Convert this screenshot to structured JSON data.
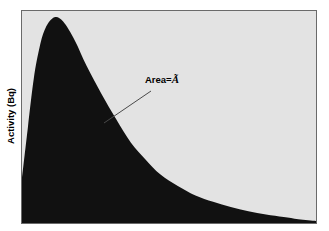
{
  "figure": {
    "background_color": "#ffffff",
    "plot_background_color": "#e3e3e3",
    "frame_color": "#6a6a6a",
    "curve_fill_color": "#111111",
    "leader_line_color": "#4a4a4a"
  },
  "axes": {
    "ylabel": "Activity (Bq)",
    "xlabel": ""
  },
  "annotation": {
    "prefix": "Area=",
    "symbol": "Ã",
    "full_text": "Area=Ã"
  },
  "chart_data": {
    "type": "area",
    "title": "",
    "xlabel": "",
    "ylabel": "Activity (Bq)",
    "grid": false,
    "legend": null,
    "annotations": [
      {
        "text": "Area=Ã",
        "label_x": 0.42,
        "label_y": 0.85,
        "points_to_x": 0.28,
        "points_to_y": 0.47
      }
    ],
    "xlim": [
      0,
      1
    ],
    "ylim": [
      0,
      1
    ],
    "series": [
      {
        "name": "Activity",
        "fill": true,
        "x": [
          0.0,
          0.02,
          0.04,
          0.06,
          0.08,
          0.11,
          0.14,
          0.18,
          0.22,
          0.27,
          0.32,
          0.37,
          0.42,
          0.47,
          0.53,
          0.59,
          0.65,
          0.71,
          0.77,
          0.83,
          0.89,
          0.94,
          1.0
        ],
        "y": [
          0.21,
          0.45,
          0.68,
          0.83,
          0.92,
          0.97,
          0.95,
          0.86,
          0.74,
          0.61,
          0.49,
          0.38,
          0.3,
          0.23,
          0.175,
          0.13,
          0.1,
          0.075,
          0.055,
          0.04,
          0.028,
          0.018,
          0.01
        ]
      }
    ]
  }
}
